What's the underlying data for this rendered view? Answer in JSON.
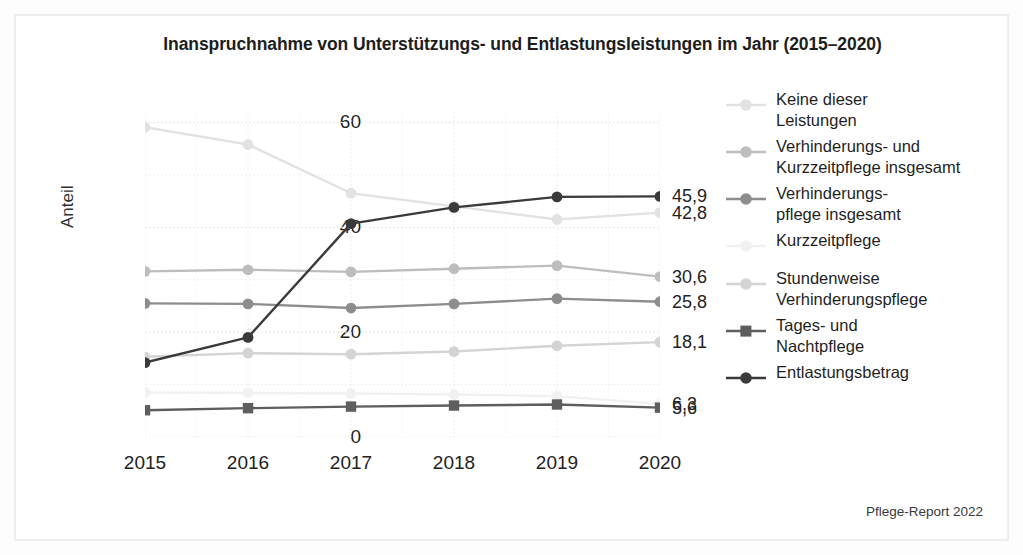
{
  "chart_data": {
    "type": "line",
    "title": "Inanspruchnahme von Unterstützungs- und Entlastungsleistungen im Jahr (2015–2020)",
    "xlabel": "",
    "ylabel": "Anteil",
    "categories": [
      "2015",
      "2016",
      "2017",
      "2018",
      "2019",
      "2020"
    ],
    "x": [
      2015,
      2016,
      2017,
      2018,
      2019,
      2020
    ],
    "ylim": [
      0,
      62
    ],
    "yticks": [
      0,
      20,
      40,
      60
    ],
    "ytick_labels": [
      "0",
      "20",
      "40",
      "60"
    ],
    "grid": true,
    "legend_position": "right",
    "source": "Pflege-Report 2022",
    "series": [
      {
        "name": "Keine dieser Leistungen",
        "label": "Keine dieser\nLeistungen",
        "label_line1": "Keine dieser",
        "label_line2": "Leistungen",
        "color": "#e2e2e2",
        "marker": "circle",
        "values": [
          59.1,
          55.8,
          46.5,
          44.0,
          41.5,
          42.8
        ],
        "end_label": "42,8"
      },
      {
        "name": "Verhinderungs- und Kurzzeitpflege insgesamt",
        "label_line1": "Verhinderungs- und",
        "label_line2": "Kurzzeitpflege insgesamt",
        "color": "#bdbdbd",
        "marker": "circle",
        "values": [
          31.6,
          31.9,
          31.5,
          32.1,
          32.7,
          30.6
        ],
        "end_label": "30,6"
      },
      {
        "name": "Verhinderungspflege insgesamt",
        "label_line1": "Verhinderungs-",
        "label_line2": "pflege insgesamt",
        "color": "#8d8d8d",
        "marker": "circle",
        "values": [
          25.5,
          25.4,
          24.6,
          25.4,
          26.4,
          25.8
        ],
        "end_label": "25,8"
      },
      {
        "name": "Kurzzeitpflege",
        "label_line1": "Kurzzeitpflege",
        "label_line2": "",
        "color": "#f1f1f1",
        "marker": "circle",
        "values": [
          8.5,
          8.4,
          8.3,
          8.1,
          7.8,
          6.3
        ],
        "end_label": "6,3"
      },
      {
        "name": "Stundenweise Verhinderungspflege",
        "label_line1": "Stundenweise",
        "label_line2": "Verhinderungspflege",
        "color": "#d4d4d4",
        "marker": "circle",
        "values": [
          15.3,
          16.0,
          15.8,
          16.3,
          17.4,
          18.1
        ],
        "end_label": "18,1"
      },
      {
        "name": "Tages- und Nachtpflege",
        "label_line1": "Tages- und",
        "label_line2": "Nachtpflege",
        "color": "#5e5e5e",
        "marker": "square",
        "values": [
          5.1,
          5.5,
          5.8,
          6.0,
          6.2,
          5.6
        ],
        "end_label": "5,6"
      },
      {
        "name": "Entlastungsbetrag",
        "label_line1": "Entlastungsbetrag",
        "label_line2": "",
        "color": "#3a3a3a",
        "marker": "circle",
        "values": [
          14.2,
          19.0,
          40.7,
          43.8,
          45.8,
          45.9
        ],
        "end_label": "45,9"
      }
    ]
  }
}
